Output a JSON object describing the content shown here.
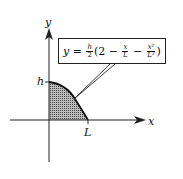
{
  "diagram": {
    "axis_labels": {
      "x": "x",
      "y": "y"
    },
    "tick_labels": {
      "h": "h",
      "L": "L"
    },
    "equation": {
      "lhs": "y",
      "equals": " = ",
      "coef_num": "h",
      "coef_den": "2",
      "open": "(2 − ",
      "t1_num": "x",
      "t1_den": "L",
      "minus": " − ",
      "t2_num": "x²",
      "t2_den": "L²",
      "close": ")"
    },
    "colors": {
      "ink": "#222222",
      "shade": "#8a8a8a"
    }
  }
}
